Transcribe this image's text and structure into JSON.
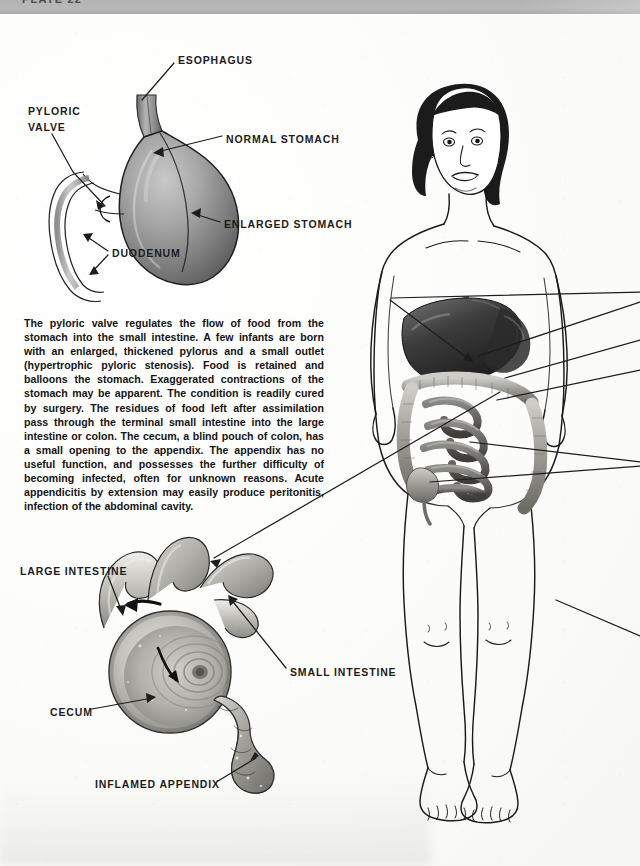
{
  "page": {
    "plate_label": "PLATE 22",
    "background_hex": "#fbfbf9",
    "header_band_hex": "#b3b3b3",
    "ink_hex": "#1c1c1c"
  },
  "body_text": "The pyloric valve regulates the flow of food from the stomach into the small intestine. A few infants are born with an enlarged, thickened pylorus and a small outlet (hypertrophic pyloric stenosis). Food is retained and balloons the stomach. Exaggerated contractions of the stomach may be apparent. The condition is readily cured by surgery. The residues of food left after assimilation pass through the terminal small intestine into the large intestine or colon. The cecum, a blind pouch of colon, has a small opening to the appendix. The appendix has no useful function, and possesses the further difficulty of becoming infected, often for unknown reasons.  Acute appendicitis by extension may easily produce peritonitis, infection of the abdominal cavity.",
  "stomach_figure": {
    "name": "stomach-and-pylorus-diagram",
    "labels": [
      {
        "id": "esophagus",
        "text": "ESOPHAGUS",
        "x": 178,
        "y": 60
      },
      {
        "id": "pyloric-valve-1",
        "text": "PYLORIC",
        "x": 28,
        "y": 112
      },
      {
        "id": "pyloric-valve-2",
        "text": "VALVE",
        "x": 28,
        "y": 128
      },
      {
        "id": "normal-stomach",
        "text": "NORMAL  STOMACH",
        "x": 226,
        "y": 139
      },
      {
        "id": "enlarged-stomach",
        "text": "ENLARGED  STOMACH",
        "x": 224,
        "y": 224
      },
      {
        "id": "duodenum",
        "text": "DUODENUM",
        "x": 112,
        "y": 253
      }
    ]
  },
  "cecum_figure": {
    "name": "cecum-and-appendix-diagram",
    "labels": [
      {
        "id": "large-intestine",
        "text": "LARGE  INTESTINE",
        "x": 20,
        "y": 571
      },
      {
        "id": "small-intestine",
        "text": "SMALL  INTESTINE",
        "x": 290,
        "y": 672
      },
      {
        "id": "cecum",
        "text": "CECUM",
        "x": 50,
        "y": 712
      },
      {
        "id": "inflamed-appendix",
        "text": "INFLAMED  APPENDIX",
        "x": 95,
        "y": 784
      }
    ]
  },
  "child_figure": {
    "name": "child-body-with-digestive-organs",
    "description_visible": false,
    "organs_shown": [
      "liver",
      "stomach",
      "large intestine",
      "small intestine",
      "cecum"
    ],
    "leader_lines_offpage": 4
  }
}
